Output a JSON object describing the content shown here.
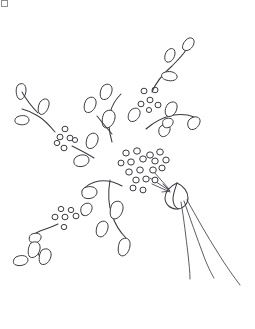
{
  "page": {
    "width": 255,
    "height": 329,
    "background_color": "#ffffff",
    "ink_color": "#3a3a42",
    "style": "black-and-white outline clip art"
  },
  "header_fragment": {
    "visible": true,
    "text": "",
    "description": "faint cropped text fragment at very top-left edge",
    "color": "#c0c0c6"
  },
  "illustration": {
    "subject": "dandelion seed head blowing in the wind",
    "nozzle": {
      "name": "crescent-bulb",
      "description": "crescent / bulb shape at lower right of seed cluster",
      "center_x": 176,
      "center_y": 196
    },
    "streams": {
      "count": 3,
      "description": "three long curved trailing lines sweeping down to the right"
    },
    "seed_clusters": [
      {
        "name": "center-cluster",
        "count": 18,
        "center_x": 140,
        "center_y": 168
      },
      {
        "name": "upper-right-cluster",
        "count": 6,
        "center_x": 152,
        "center_y": 101
      },
      {
        "name": "left-cluster",
        "count": 6,
        "center_x": 62,
        "center_y": 133
      },
      {
        "name": "lower-left-cluster",
        "count": 7,
        "center_x": 62,
        "center_y": 218
      }
    ],
    "branches": [
      {
        "name": "branch-upper-right",
        "leaves": 4
      },
      {
        "name": "branch-right-mid",
        "leaves": 4
      },
      {
        "name": "branch-upper-center",
        "leaves": 3
      },
      {
        "name": "branch-left",
        "leaves": 4
      },
      {
        "name": "branch-lower-center",
        "leaves": 4
      },
      {
        "name": "branch-lower-left",
        "leaves": 3
      }
    ]
  }
}
